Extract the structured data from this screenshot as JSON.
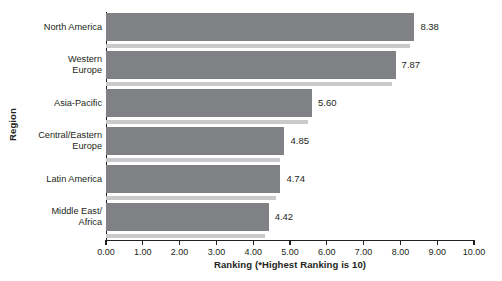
{
  "chart_data": {
    "type": "bar",
    "orientation": "horizontal",
    "title": "",
    "xlabel": "Ranking (*Highest Ranking is 10)",
    "ylabel": "Region",
    "categories": [
      "North America",
      "Western\nEurope",
      "Asia-Pacific",
      "Central/Eastern\nEurope",
      "Latin America",
      "Middle East/\nAfrica"
    ],
    "values": [
      8.38,
      7.87,
      5.6,
      4.85,
      4.74,
      4.42
    ],
    "value_labels": [
      "8.38",
      "7.87",
      "5.60",
      "4.85",
      "4.74",
      "4.42"
    ],
    "xlim": [
      0,
      10
    ],
    "xticks": [
      0,
      1,
      2,
      3,
      4,
      5,
      6,
      7,
      8,
      9,
      10
    ],
    "xtick_labels": [
      "0.00",
      "1.00",
      "2.00",
      "3.00",
      "4.00",
      "5.00",
      "6.00",
      "7.00",
      "8.00",
      "9.00",
      "10.00"
    ],
    "grid": false,
    "legend": null,
    "bar_color": "#808184",
    "shadow_color": "#c9cacc",
    "axis_color": "#231f20",
    "background": "#ffffff"
  }
}
